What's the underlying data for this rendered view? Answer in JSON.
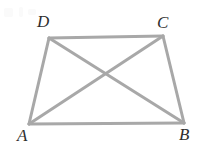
{
  "figure": {
    "width": 203,
    "height": 148,
    "background_color": "#ffffff",
    "line_color": "#a8a8a8",
    "line_width": 3,
    "label_color": "#2e2e2e"
  },
  "labels": {
    "a": "A",
    "b": "B",
    "c": "C",
    "d": "D"
  },
  "chart_data": {
    "type": "diagram",
    "points": [
      {
        "name": "A",
        "x": 29,
        "y": 124,
        "label": "A",
        "label_x": 17,
        "label_y": 127
      },
      {
        "name": "B",
        "x": 184,
        "y": 123,
        "label": "B",
        "label_x": 179,
        "label_y": 126
      },
      {
        "name": "C",
        "x": 163,
        "y": 36,
        "label": "C",
        "label_x": 157,
        "label_y": 14
      },
      {
        "name": "D",
        "x": 49,
        "y": 38,
        "label": "D",
        "label_x": 37,
        "label_y": 13
      }
    ],
    "segments": [
      {
        "name": "AB",
        "from": "A",
        "to": "B"
      },
      {
        "name": "AD",
        "from": "A",
        "to": "D"
      },
      {
        "name": "BC",
        "from": "B",
        "to": "C"
      },
      {
        "name": "DC",
        "from": "D",
        "to": "C"
      },
      {
        "name": "AC",
        "from": "A",
        "to": "C"
      },
      {
        "name": "DB",
        "from": "D",
        "to": "B"
      }
    ],
    "intersections": [
      {
        "name": "diagonal-crossing",
        "x": 106,
        "y": 74,
        "of": [
          "AC",
          "DB"
        ]
      }
    ],
    "legend": [],
    "grid": false
  }
}
